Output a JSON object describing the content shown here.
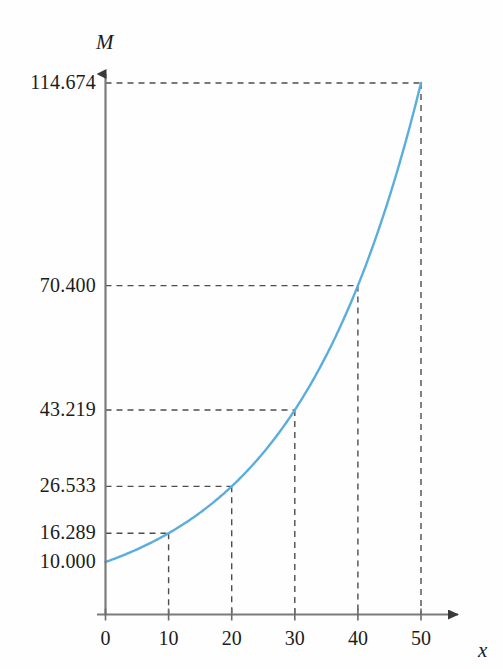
{
  "chart_data": {
    "type": "line",
    "title": "",
    "subtitle": "",
    "xlabel": "x",
    "ylabel": "M",
    "grid": "dashed-guides-to-marked-points",
    "legend": "none",
    "xlim": [
      0,
      50
    ],
    "ylim": [
      0,
      114.674
    ],
    "x": [
      0,
      10,
      20,
      30,
      40,
      50
    ],
    "values": [
      10.0,
      16.289,
      26.533,
      43.219,
      70.4,
      114.674
    ],
    "series": [
      {
        "name": "M",
        "values": [
          10.0,
          16.289,
          26.533,
          43.219,
          70.4,
          114.674
        ]
      }
    ],
    "x_tick_labels": [
      "0",
      "10",
      "20",
      "30",
      "40",
      "50"
    ],
    "y_tick_labels": [
      "10.000",
      "16.289",
      "26.533",
      "43.219",
      "70.400",
      "114.674"
    ],
    "curve_color": "#5BAEDC",
    "axis_color": "#6b6b6b",
    "guide_color": "#4d4d4d",
    "text_color": "#1c1c1c"
  },
  "axes": {
    "y_axis_name": "M",
    "x_axis_name": "x"
  },
  "y_ticks": [
    {
      "label": "114.674",
      "value": 114.674
    },
    {
      "label": "70.400",
      "value": 70.4
    },
    {
      "label": "43.219",
      "value": 43.219
    },
    {
      "label": "26.533",
      "value": 26.533
    },
    {
      "label": "16.289",
      "value": 16.289
    },
    {
      "label": "10.000",
      "value": 10.0
    }
  ],
  "x_ticks": [
    {
      "label": "0",
      "value": 0
    },
    {
      "label": "10",
      "value": 10
    },
    {
      "label": "20",
      "value": 20
    },
    {
      "label": "30",
      "value": 30
    },
    {
      "label": "40",
      "value": 40
    },
    {
      "label": "50",
      "value": 50
    }
  ]
}
